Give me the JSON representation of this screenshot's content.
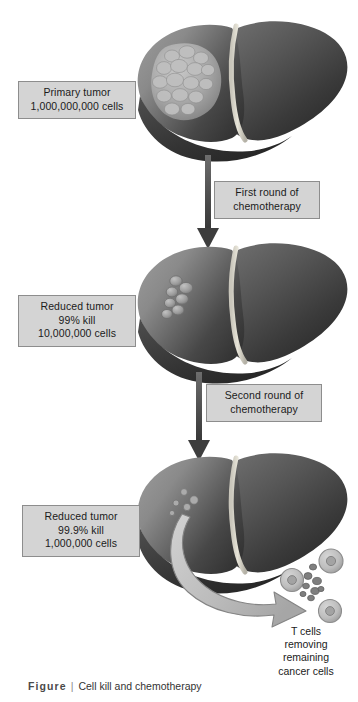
{
  "figure": {
    "caption_word": "Figure",
    "caption_separator": "|",
    "caption_title": "Cell kill and chemotherapy"
  },
  "labels": {
    "primary_tumor": {
      "line1": "Primary tumor",
      "line2": "1,000,000,000 cells"
    },
    "reduced_tumor_1": {
      "line1": "Reduced tumor",
      "line2": "99% kill",
      "line3": "10,000,000 cells"
    },
    "reduced_tumor_2": {
      "line1": "Reduced tumor",
      "line2": "99.9% kill",
      "line3": "1,000,000 cells"
    },
    "first_round": {
      "line1": "First round of",
      "line2": "chemotherapy"
    },
    "second_round": {
      "line1": "Second round of",
      "line2": "chemotherapy"
    },
    "tcell_note": {
      "line1": "T cells",
      "line2": "removing",
      "line3": "remaining",
      "line4": "cancer cells"
    }
  },
  "diagram": {
    "type": "medical-illustration-flow",
    "stages": [
      {
        "name": "primary-tumor-liver",
        "tumor_burden_cells": 1000000000,
        "kill_percent": 0,
        "tumor_depiction": "large lobulated mass on left lobe"
      },
      {
        "name": "reduced-tumor-liver-1",
        "tumor_burden_cells": 10000000,
        "kill_percent": 99,
        "tumor_depiction": "small cluster of nodules on left lobe"
      },
      {
        "name": "reduced-tumor-liver-2",
        "tumor_burden_cells": 1000000,
        "kill_percent": 99.9,
        "tumor_depiction": "few scattered cells on left lobe"
      }
    ],
    "transitions": [
      {
        "name": "first-round-of-chemotherapy",
        "from": "primary-tumor-liver",
        "to": "reduced-tumor-liver-1"
      },
      {
        "name": "second-round-of-chemotherapy",
        "from": "reduced-tumor-liver-1",
        "to": "reduced-tumor-liver-2"
      }
    ],
    "immune_cells": {
      "t_cells": 3,
      "cancer_cells": 8
    }
  },
  "colors": {
    "background": "#ffffff",
    "box_fill": "#d4d4d4",
    "box_border": "#8d8d8d",
    "text": "#1b1b1b",
    "caption_text": "#3b3b3b",
    "liver_light": "#8f8f8f",
    "liver_dark": "#3a3a3a",
    "liver_mid": "#636363",
    "tumor_light": "#b6b6b6",
    "arrow_vertical": "#545454",
    "arrow_curved_fill": "#b9b9b9",
    "arrow_curved_stroke": "#7d7d7d",
    "tcell_fill": "#bfbfbf",
    "cancer_cell_fill": "#7c7c7c"
  },
  "icons": {
    "down_arrow": "down-arrow-icon",
    "curved_arrow": "curved-arrow-icon"
  }
}
